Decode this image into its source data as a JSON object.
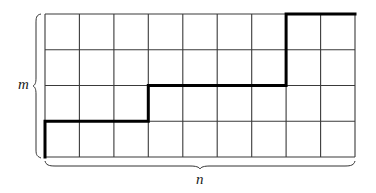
{
  "diagram": {
    "type": "lattice-path-grid",
    "grid": {
      "columns": 9,
      "rows": 4,
      "origin_x": 45,
      "origin_y": 14,
      "width": 310,
      "height": 143,
      "line_color": "#333333"
    },
    "path": {
      "description": "monotone lattice path from bottom-left to top-right",
      "steps_in_cells": [
        [
          0,
          4
        ],
        [
          0,
          3
        ],
        [
          3,
          3
        ],
        [
          3,
          2
        ],
        [
          7,
          2
        ],
        [
          7,
          0
        ],
        [
          9,
          0
        ]
      ],
      "color": "#000000"
    },
    "labels": {
      "rows_label": "m",
      "columns_label": "n"
    }
  }
}
